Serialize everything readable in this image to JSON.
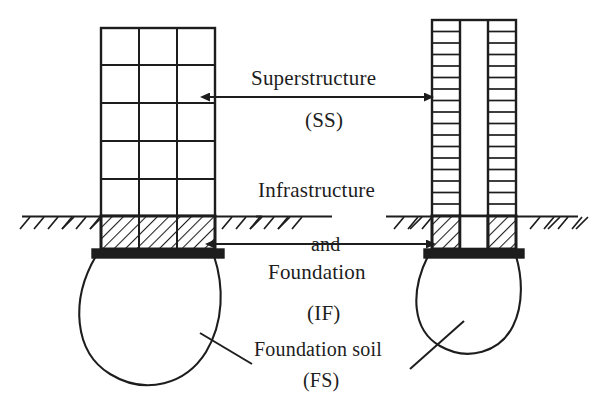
{
  "figure": {
    "kind": "engineering-section-diagram",
    "background_color": "#ffffff",
    "ink_color": "#1d1d1d",
    "width": 598,
    "height": 404
  },
  "labels": {
    "superstructure": "Superstructure",
    "superstructure_abbr": "(SS)",
    "infrastructure": "Infrastructure",
    "and": "and",
    "foundation": "Foundation",
    "infrastructure_abbr": "(IF)",
    "foundation_soil": "Foundation soil",
    "foundation_soil_abbr": "(FS)"
  },
  "zones": [
    {
      "id": "SS",
      "name": "Superstructure",
      "abbr": "(SS)",
      "span": "above ground line"
    },
    {
      "id": "IF",
      "name": "Infrastructure and Foundation",
      "abbr": "(IF)",
      "span": "ground line to footing"
    },
    {
      "id": "FS",
      "name": "Foundation soil",
      "abbr": "(FS)",
      "span": "soil bulb below footing"
    }
  ],
  "left_structure": {
    "name": "wide-frame-building",
    "bays": 3,
    "superstructure_floors": 5,
    "frame": {
      "x": 101,
      "y": 28,
      "width": 114,
      "height": 188
    },
    "basement": {
      "hatched": true,
      "bays": 3,
      "x": 101,
      "y": 216,
      "width": 114,
      "height": 33
    },
    "footing": {
      "x": 92,
      "y": 249,
      "width": 132,
      "height": 9,
      "fill": "solid-black"
    },
    "soil_bulb": {
      "center_x": 158,
      "top_y": 258,
      "radius_x": 66,
      "bottom_y": 384
    }
  },
  "right_structure": {
    "name": "tall-narrow-tower",
    "bays": 3,
    "superstructure_floors": 17,
    "core_open": true,
    "frame": {
      "x": 432,
      "y": 20,
      "width": 84,
      "height": 196
    },
    "basement": {
      "hatched": true,
      "hatched_bays": [
        1,
        3
      ],
      "x": 432,
      "y": 216,
      "width": 84,
      "height": 33
    },
    "footing": {
      "x": 424,
      "y": 249,
      "width": 100,
      "height": 9,
      "fill": "solid-black"
    },
    "soil_bulb": {
      "center_x": 474,
      "top_y": 258,
      "radius_x": 50,
      "bottom_y": 352
    }
  },
  "ground_line": {
    "y": 216,
    "segments": [
      [
        22,
        260
      ],
      [
        256,
        330
      ],
      [
        388,
        576
      ]
    ],
    "hatch_ticks": true
  },
  "arrows": {
    "superstructure": {
      "y": 97,
      "x1": 208,
      "x2": 426,
      "double_headed": true
    },
    "infrastructure": {
      "y": 244,
      "x1": 213,
      "x2": 428,
      "double_headed": true
    }
  },
  "leader_lines": [
    {
      "from": "foundation-soil-label",
      "to": "left-soil-bulb",
      "x1": 250,
      "y1": 363,
      "x2": 203,
      "y2": 334
    },
    {
      "from": "foundation-soil-label",
      "to": "right-soil-bulb",
      "x1": 412,
      "y1": 368,
      "x2": 463,
      "y2": 322
    }
  ]
}
